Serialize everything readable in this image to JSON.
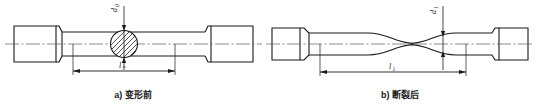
{
  "figure": {
    "background_color": "#ffffff",
    "line_color": "#1a1a1a",
    "centerline_color": "#5a5a5a",
    "hatch_color": "#1a1a1a",
    "width": 535,
    "height": 106
  },
  "panels": [
    {
      "id": "a",
      "caption": "a) 变形前",
      "caption_prefix": "a)",
      "caption_text": "变形前",
      "specimen": "round-tensile-specimen-undeformed",
      "dimensions": [
        {
          "name": "diameter",
          "symbol": "d",
          "subscript": "0",
          "orientation": "vertical",
          "position": "top-center",
          "description": "original specimen diameter"
        },
        {
          "name": "gauge-length",
          "symbol": "l",
          "subscript": "0",
          "orientation": "horizontal",
          "position": "bottom",
          "description": "original gauge length"
        }
      ],
      "section_view": {
        "type": "circular-cross-section",
        "hatched": true,
        "description": "hatched circle showing round cross section"
      }
    },
    {
      "id": "b",
      "caption": "b) 断裂后",
      "caption_prefix": "b)",
      "caption_text": "断裂后",
      "specimen": "round-tensile-specimen-fractured",
      "dimensions": [
        {
          "name": "neck-diameter",
          "symbol": "d",
          "subscript": "1",
          "orientation": "vertical",
          "position": "top-center",
          "description": "diameter at necked fracture region"
        },
        {
          "name": "final-gauge-length",
          "symbol": "l",
          "subscript": "1",
          "orientation": "horizontal",
          "position": "bottom",
          "description": "gauge length after fracture"
        }
      ],
      "feature": {
        "type": "necking",
        "description": "narrowed necking region at fracture location"
      }
    }
  ]
}
